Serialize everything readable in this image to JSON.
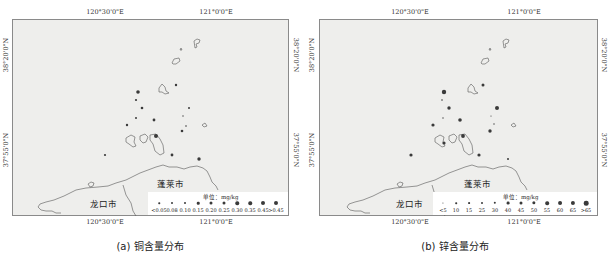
{
  "panels": [
    {
      "id": "a",
      "caption": "(a) 铜含量分布",
      "lon_ticks": [
        "120°30'0\"E",
        "121°0'0\"E"
      ],
      "lat_ticks": [
        "38°20'0\"N",
        "37°55'0\"N"
      ],
      "cities": [
        "蓬莱市",
        "龙口市"
      ],
      "legend": {
        "title": "单位：mg/kg",
        "labels": [
          "<0.05",
          "0.08",
          "0.10",
          "0.15",
          "0.20",
          "0.25",
          "0.30",
          "0.35",
          "0.45",
          ">0.45"
        ]
      }
    },
    {
      "id": "b",
      "caption": "(b) 锌含量分布",
      "lon_ticks": [
        "120°30'0\"E",
        "121°0'0\"E"
      ],
      "lat_ticks": [
        "38°20'0\"N",
        "37°55'0\"N"
      ],
      "cities": [
        "蓬莱市",
        "龙口市"
      ],
      "legend": {
        "title": "单位：mg/kg",
        "labels": [
          "<5",
          "10",
          "15",
          "25",
          "30",
          "40",
          "45",
          "50",
          "55",
          "60",
          "65",
          ">65"
        ]
      }
    }
  ],
  "colors": {
    "sea": "#eeeeec",
    "frame": "#8a8a8a",
    "point": "#3a3a3a",
    "coast": "#555555"
  }
}
